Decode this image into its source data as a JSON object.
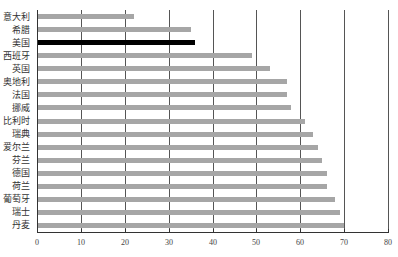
{
  "chart_data": {
    "type": "bar",
    "orientation": "horizontal",
    "title": "",
    "xlabel": "",
    "ylabel": "",
    "xlim": [
      0,
      80
    ],
    "xticks": [
      0,
      10,
      20,
      30,
      40,
      50,
      60,
      70,
      80
    ],
    "grid": "vertical",
    "legend": null,
    "categories": [
      "意大利",
      "希腊",
      "美国",
      "西班牙",
      "英国",
      "奥地利",
      "法国",
      "挪威",
      "比利时",
      "瑞典",
      "爱尔兰",
      "芬兰",
      "德国",
      "荷兰",
      "葡萄牙",
      "瑞士",
      "丹麦"
    ],
    "values": [
      22,
      35,
      36,
      49,
      53,
      57,
      57,
      58,
      61,
      63,
      64,
      65,
      66,
      66,
      68,
      69,
      70
    ],
    "highlight": "美国",
    "colors": {
      "default": "#a6a6a6",
      "highlight": "#000000",
      "grid": "#555555"
    }
  }
}
